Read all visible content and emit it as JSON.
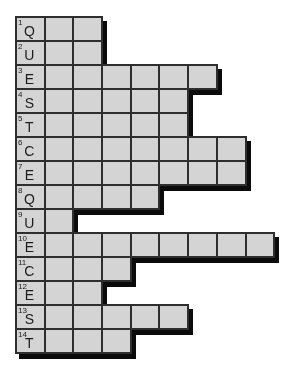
{
  "puzzle": {
    "grid_rows": 14,
    "rows": [
      {
        "number": "1",
        "letter": "Q",
        "length": 3
      },
      {
        "number": "2",
        "letter": "U",
        "length": 3
      },
      {
        "number": "3",
        "letter": "E",
        "length": 7
      },
      {
        "number": "4",
        "letter": "S",
        "length": 6
      },
      {
        "number": "5",
        "letter": "T",
        "length": 6
      },
      {
        "number": "6",
        "letter": "C",
        "length": 8
      },
      {
        "number": "7",
        "letter": "E",
        "length": 8
      },
      {
        "number": "8",
        "letter": "Q",
        "length": 5
      },
      {
        "number": "9",
        "letter": "U",
        "length": 2
      },
      {
        "number": "10",
        "letter": "E",
        "length": 9
      },
      {
        "number": "11",
        "letter": "C",
        "length": 4
      },
      {
        "number": "12",
        "letter": "E",
        "length": 3
      },
      {
        "number": "13",
        "letter": "S",
        "length": 6
      },
      {
        "number": "14",
        "letter": "T",
        "length": 4
      }
    ],
    "colors": {
      "cell_fill": "#d4d4d4",
      "grid_line": "#2e2e2e",
      "shadow": "#0b0b0b",
      "background": "#ffffff",
      "text": "#1c1c1c"
    }
  }
}
